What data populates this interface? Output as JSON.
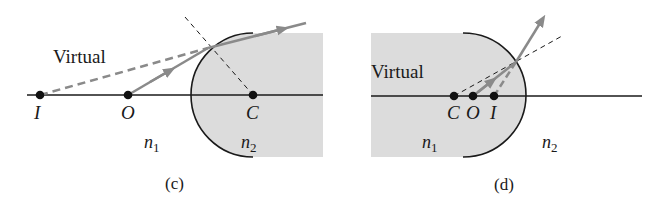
{
  "panels": [
    {
      "id": "c",
      "caption": "(c)",
      "virtual_label": "Virtual",
      "points": {
        "I": "I",
        "O": "O",
        "C": "C"
      },
      "media": {
        "n1": "n",
        "n1_sub": "1",
        "n2": "n",
        "n2_sub": "2"
      }
    },
    {
      "id": "d",
      "caption": "(d)",
      "virtual_label": "Virtual",
      "points": {
        "C": "C",
        "O": "O",
        "I": "I"
      },
      "media": {
        "n1": "n",
        "n1_sub": "1",
        "n2": "n",
        "n2_sub": "2"
      }
    }
  ],
  "colors": {
    "medium_fill": "#dcdcdc",
    "ray": "#8a8a8a",
    "line": "#1a1a1a"
  }
}
